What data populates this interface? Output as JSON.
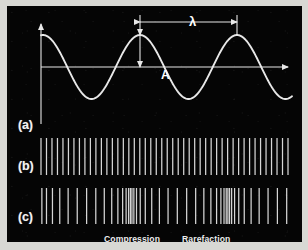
{
  "figure": {
    "background_color": "#d8d8d4",
    "panel_color": "#050505",
    "stroke_color": "#e8e8e8"
  },
  "rows": [
    {
      "id": "a",
      "label": "(a)",
      "description": "transverse sine wave with amplitude and wavelength annotations"
    },
    {
      "id": "b",
      "label": "(b)",
      "description": "uniformly spaced vertical lines representing undisturbed medium"
    },
    {
      "id": "c",
      "label": "(c)",
      "description": "vertical lines with varying density showing compressions and rarefactions"
    }
  ],
  "annotations": {
    "wavelength_symbol": "λ",
    "amplitude_symbol": "A",
    "compression": "Compression",
    "rarefaction": "Rarefaction"
  },
  "chart_data": {
    "type": "line",
    "title": "",
    "xlabel": "",
    "ylabel": "",
    "grid": false,
    "legend": null,
    "axis": {
      "x_axis_y": 67,
      "x_start": 41,
      "x_end": 288,
      "y_axis_x": 41,
      "y_top": 24,
      "y_bottom": 124
    },
    "wave": {
      "amplitude_px": 32,
      "wavelength_px": 97,
      "phase_start_value": 0.62,
      "peak_positions_px": [
        140,
        237
      ],
      "trough_positions_px": [
        92,
        189
      ],
      "path_start_x": 41,
      "path_end_x": 292
    },
    "wavelength_marker": {
      "from_x": 140,
      "to_x": 237,
      "y": 22,
      "label": "λ"
    },
    "amplitude_marker": {
      "x": 140,
      "from_y": 35,
      "to_y": 67,
      "label": "A"
    },
    "row_b_lines": {
      "y_top": 138,
      "y_bottom": 175,
      "x_start": 41,
      "x_end": 288,
      "count": 46,
      "uniform": true
    },
    "row_c_lines": {
      "y_top": 188,
      "y_bottom": 224,
      "x_start": 41,
      "x_end": 288,
      "count": 46,
      "uniform": false,
      "compression_centers_px": [
        131,
        228
      ],
      "rarefaction_centers_px": [
        83,
        180
      ],
      "displacement_amplitude_px": 11
    }
  }
}
